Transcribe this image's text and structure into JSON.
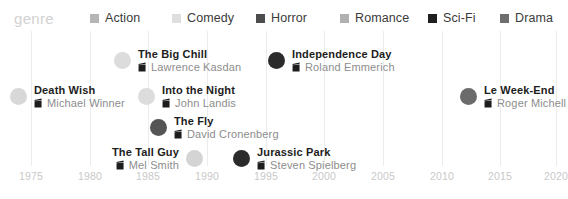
{
  "legend": {
    "title": "genre",
    "title_color": "#d2d2d2",
    "items": [
      {
        "label": "Action",
        "color": "#b5b5b5",
        "x": 90
      },
      {
        "label": "Comedy",
        "color": "#dedede",
        "x": 172
      },
      {
        "label": "Romance",
        "color": "#b0b0b0",
        "x": 340
      },
      {
        "label": "Horror",
        "color": "#4d4d4d",
        "x": 256
      },
      {
        "label": "Sci-Fi",
        "color": "#1f1f1f",
        "x": 428
      },
      {
        "label": "Drama",
        "color": "#6e6e6e",
        "x": 500
      }
    ]
  },
  "axis": {
    "ticks": [
      {
        "label": "1975",
        "x": 31
      },
      {
        "label": "1980",
        "x": 90
      },
      {
        "label": "1985",
        "x": 148
      },
      {
        "label": "1990",
        "x": 207
      },
      {
        "label": "1995",
        "x": 266
      },
      {
        "label": "2000",
        "x": 324
      },
      {
        "label": "2005",
        "x": 383
      },
      {
        "label": "2010",
        "x": 442
      },
      {
        "label": "2015",
        "x": 500
      },
      {
        "label": "2020",
        "x": 556
      }
    ],
    "min": 1975,
    "max": 2020,
    "grid": true,
    "grid_color": "#ececec"
  },
  "icons": {
    "director": "clapperboard-icon"
  },
  "chart_data": {
    "type": "scatter",
    "title": "genre",
    "xlabel": "",
    "ylabel": "",
    "xlim": [
      1975,
      2020
    ],
    "grid": true,
    "legend_position": "top",
    "categories": [
      "Action",
      "Comedy",
      "Romance",
      "Horror",
      "Sci-Fi",
      "Drama"
    ],
    "points": [
      {
        "title": "Death Wish",
        "director": "Michael Winner",
        "year": 1974,
        "genre": "Comedy",
        "color": "#d8d8d8",
        "x": 19,
        "y": 96,
        "side": "right"
      },
      {
        "title": "The Big Chill",
        "director": "Lawrence Kasdan",
        "year": 1983,
        "genre": "Comedy",
        "color": "#dcdcdc",
        "x": 123,
        "y": 60,
        "side": "right"
      },
      {
        "title": "Into the Night",
        "director": "John Landis",
        "year": 1985,
        "genre": "Comedy",
        "color": "#dcdcdc",
        "x": 147,
        "y": 96,
        "side": "right"
      },
      {
        "title": "The Fly",
        "director": "David Cronenberg",
        "year": 1986,
        "genre": "Horror",
        "color": "#555555",
        "x": 159,
        "y": 127,
        "side": "right"
      },
      {
        "title": "The Tall Guy",
        "director": "Mel Smith",
        "year": 1989,
        "genre": "Comedy",
        "color": "#d4d4d4",
        "x": 194,
        "y": 158,
        "side": "left"
      },
      {
        "title": "Jurassic Park",
        "director": "Steven Spielberg",
        "year": 1993,
        "genre": "Sci-Fi",
        "color": "#2b2b2b",
        "x": 242,
        "y": 158,
        "side": "right"
      },
      {
        "title": "Independence Day",
        "director": "Roland Emmerich",
        "year": 1996,
        "genre": "Sci-Fi",
        "color": "#2b2b2b",
        "x": 277,
        "y": 60,
        "side": "right"
      },
      {
        "title": "Le Week-End",
        "director": "Roger Michell",
        "year": 2013,
        "genre": "Drama",
        "color": "#6b6b6b",
        "x": 469,
        "y": 96,
        "side": "right"
      }
    ]
  }
}
